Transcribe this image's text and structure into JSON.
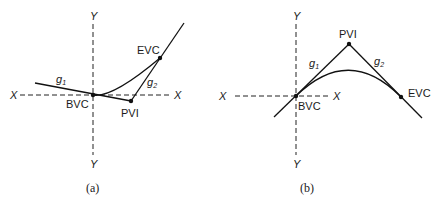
{
  "diagram_a": {
    "caption": "(a)",
    "axis_labels": {
      "y_top": "Y",
      "y_bottom": "Y",
      "x_left": "X",
      "x_right": "X"
    },
    "points": {
      "bvc": "BVC",
      "pvi": "PVI",
      "evc": "EVC"
    },
    "grades": {
      "g1": "g",
      "g1_sub": "1",
      "g2": "g",
      "g2_sub": "2"
    },
    "description": "Sag vertical curve: grade g1 descending into PVI, grade g2 rising; parabolic curve from BVC to EVC"
  },
  "diagram_b": {
    "caption": "(b)",
    "axis_labels": {
      "y_top": "Y",
      "y_bottom": "Y",
      "x_left": "X",
      "x_right": "X"
    },
    "points": {
      "bvc": "BVC",
      "pvi": "PVI",
      "evc": "EVC"
    },
    "grades": {
      "g1": "g",
      "g1_sub": "1",
      "g2": "g",
      "g2_sub": "2"
    },
    "description": "Crest vertical curve: grade g1 rising to PVI, grade g2 descending; parabolic curve from BVC to EVC"
  },
  "colors": {
    "line": "#111111",
    "background": "#ffffff"
  }
}
